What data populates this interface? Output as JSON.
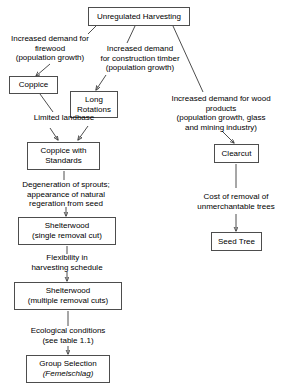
{
  "diagram": {
    "line_color": "#3a3a3a",
    "box_border_color": "#4d4d4d",
    "background": "#ffffff",
    "nodes": [
      {
        "id": "unregulated_harvesting",
        "line1": "Unregulated Harvesting",
        "line2": ""
      },
      {
        "id": "coppice",
        "line1": "Coppice",
        "line2": ""
      },
      {
        "id": "long_rotations",
        "line1": "Long",
        "line2": "Rotations"
      },
      {
        "id": "coppice_with_standards",
        "line1": "Coppice with",
        "line2": "Standards"
      },
      {
        "id": "shelterwood_single",
        "line1": "Shelterwood",
        "line2": "(single removal cut)"
      },
      {
        "id": "shelterwood_multiple",
        "line1": "Shelterwood",
        "line2": "(multiple removal cuts)"
      },
      {
        "id": "group_selection",
        "line1": "Group Selection",
        "line2": "(Femelschlag)",
        "line2_italic_word": "Femelschlag"
      },
      {
        "id": "clearcut",
        "line1": "Clearcut",
        "line2": ""
      },
      {
        "id": "seed_tree",
        "line1": "Seed Tree",
        "line2": ""
      }
    ],
    "edge_labels": [
      {
        "id": "firewood_demand",
        "lines": [
          "Increased demand for",
          "firewood",
          "(population growth)"
        ]
      },
      {
        "id": "construction_timber_demand",
        "lines": [
          "Increased demand",
          "for construction timber",
          "(population growth)"
        ]
      },
      {
        "id": "wood_products_demand",
        "lines": [
          "Increased demand for wood",
          "products",
          "(population growth, glass",
          "and mining industry)"
        ]
      },
      {
        "id": "limited_landbase",
        "lines": [
          "Limited landbase"
        ]
      },
      {
        "id": "degeneration_of_sprouts",
        "lines": [
          "Degeneration of sprouts;",
          "appearance of natural",
          "regeration from seed"
        ]
      },
      {
        "id": "flexibility_harvesting",
        "lines": [
          "Flexibility in",
          "harvesting schedule"
        ]
      },
      {
        "id": "ecological_conditions",
        "lines": [
          "Ecological conditions",
          "(see table 1.1)"
        ]
      },
      {
        "id": "cost_of_removal",
        "lines": [
          "Cost of removal of",
          "unmerchantable trees"
        ]
      }
    ]
  }
}
